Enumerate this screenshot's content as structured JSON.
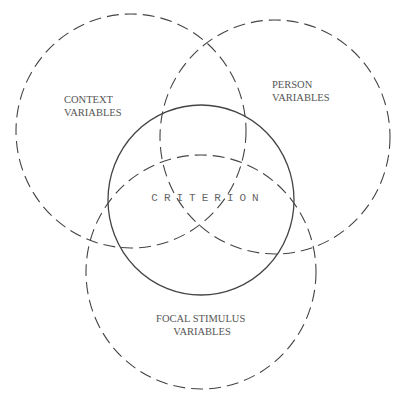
{
  "diagram": {
    "type": "venn",
    "colors": {
      "stroke": "#444444",
      "text": "#555555",
      "background": "#ffffff"
    },
    "sets": [
      {
        "id": "context",
        "lines": [
          "CONTEXT",
          "VARIABLES"
        ],
        "style": "dashed"
      },
      {
        "id": "person",
        "lines": [
          "PERSON",
          "VARIABLES"
        ],
        "style": "dashed"
      },
      {
        "id": "focal",
        "lines": [
          "FOCAL STIMULUS",
          "VARIABLES"
        ],
        "style": "dashed"
      },
      {
        "id": "criterion",
        "lines": [
          "CRITERION"
        ],
        "style": "solid"
      }
    ]
  }
}
